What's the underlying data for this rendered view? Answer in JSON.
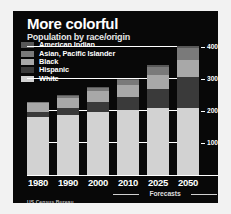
{
  "header": {
    "title": "More colorful",
    "subtitle": "Population by race/origin"
  },
  "source": "US Census Bureau",
  "forecast_note": "Forecasts",
  "colors": {
    "panel_background": "#080808",
    "page_background": "#f2f2f2",
    "gridline": "#ffffff",
    "text": "#ffffff",
    "white_series": "#d2d2d2",
    "hispanic_series": "#3a3a3a",
    "black_series": "#a8a8a8",
    "asian_series": "#7a7a7a",
    "american_indian_series": "#585858"
  },
  "legend": {
    "position": "top-left",
    "items": [
      {
        "label": "American Indian",
        "color": "#585858"
      },
      {
        "label": "Asian, Pacific Islander",
        "color": "#7a7a7a"
      },
      {
        "label": "Black",
        "color": "#a8a8a8"
      },
      {
        "label": "Hispanic",
        "color": "#3a3a3a"
      },
      {
        "label": "White",
        "color": "#d2d2d2"
      }
    ]
  },
  "chart_data": {
    "type": "bar",
    "title": "More colorful",
    "subtitle": "Population by race/origin",
    "xlabel": "",
    "ylabel": "",
    "unit": "millions",
    "stacked": true,
    "grid": true,
    "ylim": [
      0,
      430
    ],
    "yticks": [
      100,
      200,
      300,
      400
    ],
    "ytick_labels": [
      "100",
      "200",
      "300",
      "400"
    ],
    "categories": [
      "1980",
      "1990",
      "2000",
      "2010",
      "2025",
      "2050"
    ],
    "forecast_categories": [
      "2010",
      "2025",
      "2050"
    ],
    "series": [
      {
        "name": "White",
        "color": "#d2d2d2",
        "values": [
          181,
          188,
          196,
          202,
          210,
          208
        ]
      },
      {
        "name": "Hispanic",
        "color": "#3a3a3a",
        "values": [
          15,
          22,
          31,
          41,
          59,
          97
        ]
      },
      {
        "name": "Black",
        "color": "#a8a8a8",
        "values": [
          27,
          30,
          34,
          38,
          44,
          54
        ]
      },
      {
        "name": "Asian, Pacific Islander",
        "color": "#7a7a7a",
        "values": [
          4,
          7,
          11,
          16,
          25,
          38
        ]
      },
      {
        "name": "American Indian",
        "color": "#585858",
        "values": [
          2,
          2,
          3,
          3,
          4,
          5
        ]
      }
    ],
    "totals": [
      229,
      249,
      275,
      300,
      342,
      402
    ]
  }
}
